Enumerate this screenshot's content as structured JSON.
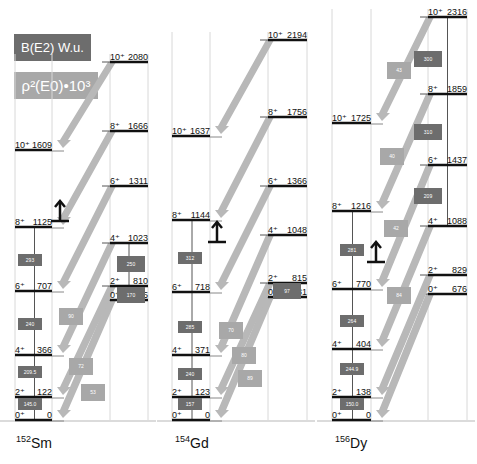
{
  "legend": {
    "be2_label": "B(E2) W.u.",
    "e0_label": "ρ²(E0)•10³"
  },
  "colors": {
    "be2_box": "#6d6d6d",
    "e0_arrow": "#b8b8b8",
    "e0_box": "#a8a8a8",
    "level_line": "#111111",
    "column_line": "#d8d8d8"
  },
  "nuclei": [
    {
      "label_mass": "152",
      "label_element": "Sm",
      "ground_band": [
        {
          "spin": "0⁺",
          "energy": "0"
        },
        {
          "spin": "2⁺",
          "energy": "122"
        },
        {
          "spin": "4⁺",
          "energy": "366"
        },
        {
          "spin": "6⁺",
          "energy": "707"
        },
        {
          "spin": "8⁺",
          "energy": "1125"
        },
        {
          "spin": "10⁺",
          "energy": "1609"
        }
      ],
      "beta_band": [
        {
          "spin": "0⁺",
          "energy": "685"
        },
        {
          "spin": "2⁺",
          "energy": "810"
        },
        {
          "spin": "4⁺",
          "energy": "1023"
        },
        {
          "spin": "6⁺",
          "energy": "1311"
        },
        {
          "spin": "8⁺",
          "energy": "1666"
        },
        {
          "spin": "10⁺",
          "energy": "2080"
        }
      ],
      "ground_be2": [
        "145.0",
        "209.5",
        "240",
        "293"
      ],
      "beta_be2": [
        "170",
        "250"
      ],
      "e0_values": [
        "53",
        "72",
        "90"
      ]
    },
    {
      "label_mass": "154",
      "label_element": "Gd",
      "ground_band": [
        {
          "spin": "0⁺",
          "energy": "0"
        },
        {
          "spin": "2⁺",
          "energy": "123"
        },
        {
          "spin": "4⁺",
          "energy": "371"
        },
        {
          "spin": "6⁺",
          "energy": "718"
        },
        {
          "spin": "8⁺",
          "energy": "1144"
        },
        {
          "spin": "10⁺",
          "energy": "1637"
        }
      ],
      "beta_band": [
        {
          "spin": "0⁺",
          "energy": "681"
        },
        {
          "spin": "2⁺",
          "energy": "815"
        },
        {
          "spin": "4⁺",
          "energy": "1048"
        },
        {
          "spin": "6⁺",
          "energy": "1366"
        },
        {
          "spin": "8⁺",
          "energy": "1756"
        },
        {
          "spin": "10⁺",
          "energy": "2194"
        }
      ],
      "ground_be2": [
        "157",
        "240",
        "285",
        "312"
      ],
      "beta_be2": [
        "97"
      ],
      "e0_values": [
        "89",
        "80",
        "70"
      ]
    },
    {
      "label_mass": "156",
      "label_element": "Dy",
      "ground_band": [
        {
          "spin": "0⁺",
          "energy": "0"
        },
        {
          "spin": "2⁺",
          "energy": "138"
        },
        {
          "spin": "4⁺",
          "energy": "404"
        },
        {
          "spin": "6⁺",
          "energy": "770"
        },
        {
          "spin": "8⁺",
          "energy": "1216"
        },
        {
          "spin": "10⁺",
          "energy": "1725"
        }
      ],
      "beta_band": [
        {
          "spin": "0⁺",
          "energy": "676"
        },
        {
          "spin": "2⁺",
          "energy": "829"
        },
        {
          "spin": "4⁺",
          "energy": "1088"
        },
        {
          "spin": "6⁺",
          "energy": "1437"
        },
        {
          "spin": "8⁺",
          "energy": "1859"
        },
        {
          "spin": "10⁺",
          "energy": "2316"
        }
      ],
      "ground_be2": [
        "150.0",
        "244.9",
        "264",
        "281"
      ],
      "beta_be2": [
        "209",
        "310",
        "300"
      ],
      "e0_values": [
        "84",
        "42",
        "40",
        "43"
      ]
    }
  ]
}
